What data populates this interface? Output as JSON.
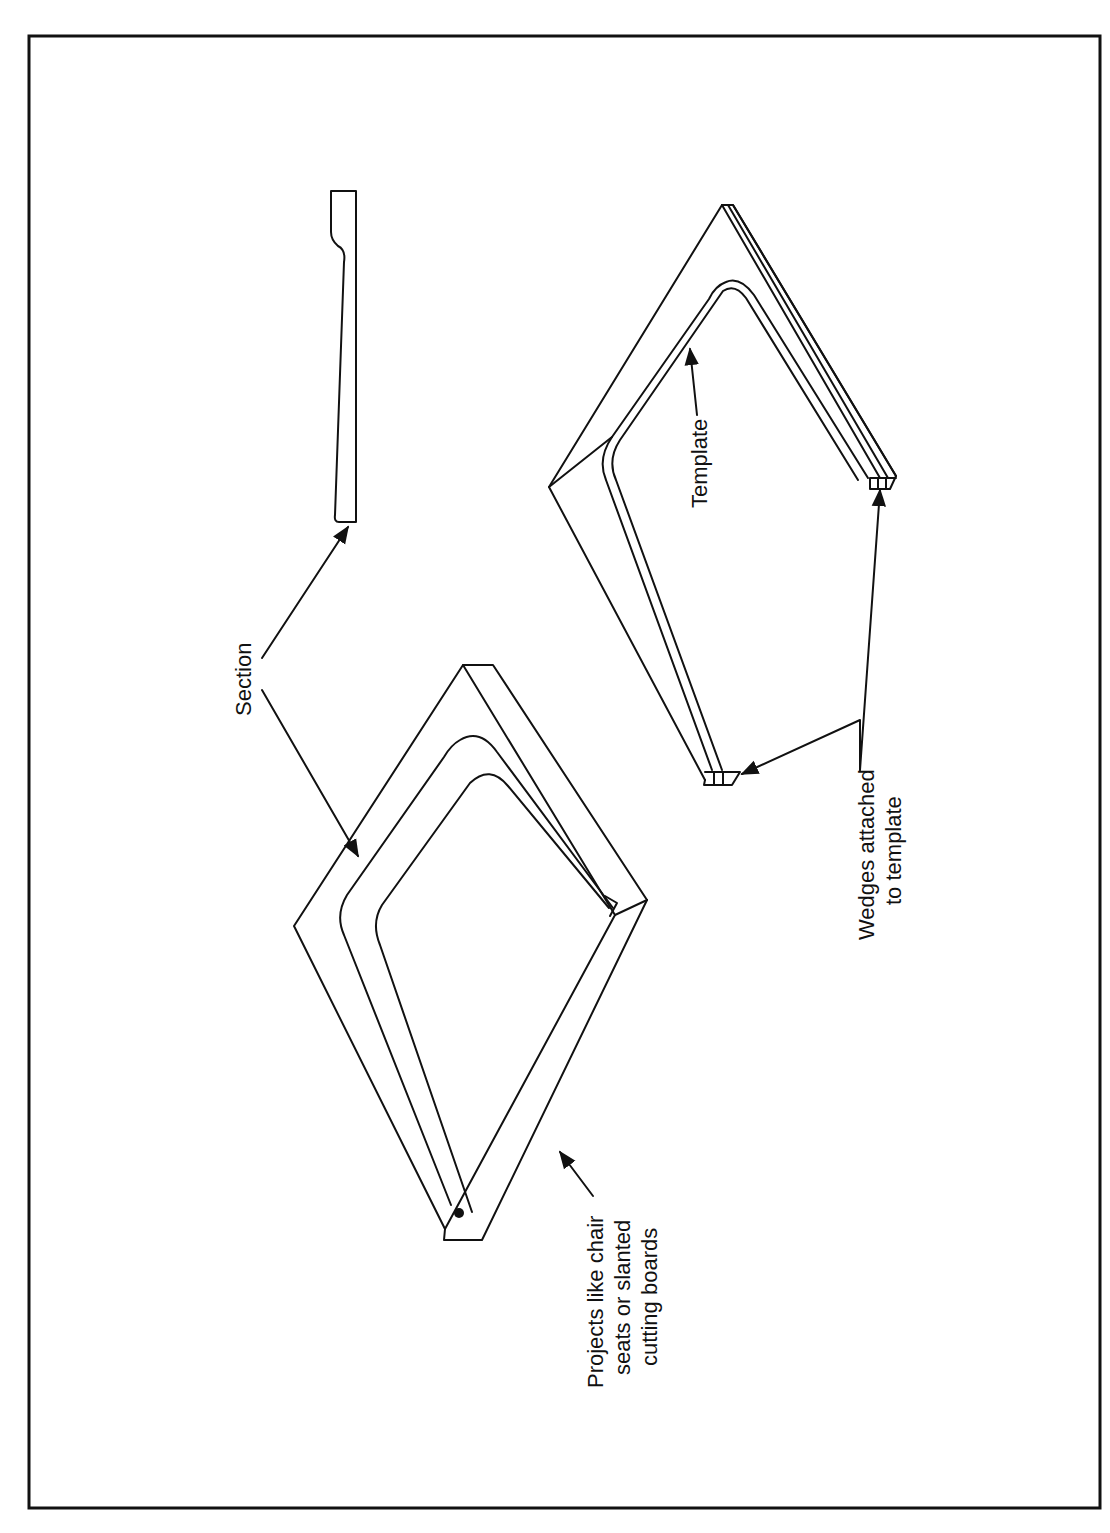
{
  "figure": {
    "background_color": "#ffffff",
    "line_color": "#111111",
    "orientation": "rotated-90-ccw",
    "labels": {
      "section": "Section",
      "template": "Template",
      "projects": [
        "Projects like chair",
        "seats or slanted",
        "cutting boards"
      ],
      "wedges": [
        "Wedges attached",
        "to template"
      ]
    },
    "parts": [
      {
        "name": "section-profile",
        "description": "Tapered board cross-section"
      },
      {
        "name": "slanted-board",
        "description": "Board with tapered recess"
      },
      {
        "name": "template-jig",
        "description": "Template with attached wedges"
      }
    ]
  }
}
